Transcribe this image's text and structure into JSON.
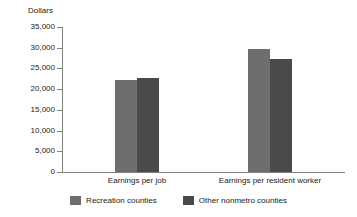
{
  "chart_data": {
    "type": "bar",
    "title": "",
    "xlabel": "",
    "ylabel": "Dollars",
    "ylim": [
      0,
      35000
    ],
    "yticks": [
      "0",
      "5,000",
      "10,000",
      "15,000",
      "20,000",
      "25,000",
      "30,000",
      "35,000"
    ],
    "ytick_values": [
      0,
      5000,
      10000,
      15000,
      20000,
      25000,
      30000,
      35000
    ],
    "grid": false,
    "legend_position": "bottom",
    "categories": [
      "Earnings per job",
      "Earnings per resident worker"
    ],
    "series": [
      {
        "name": "Recreation counties",
        "color": "#6e6e6e",
        "values": [
          22200,
          29700
        ]
      },
      {
        "name": "Other nonmetro counties",
        "color": "#4a4a4a",
        "values": [
          22600,
          27300
        ]
      }
    ]
  },
  "axis": {
    "line_color": "#808080"
  }
}
